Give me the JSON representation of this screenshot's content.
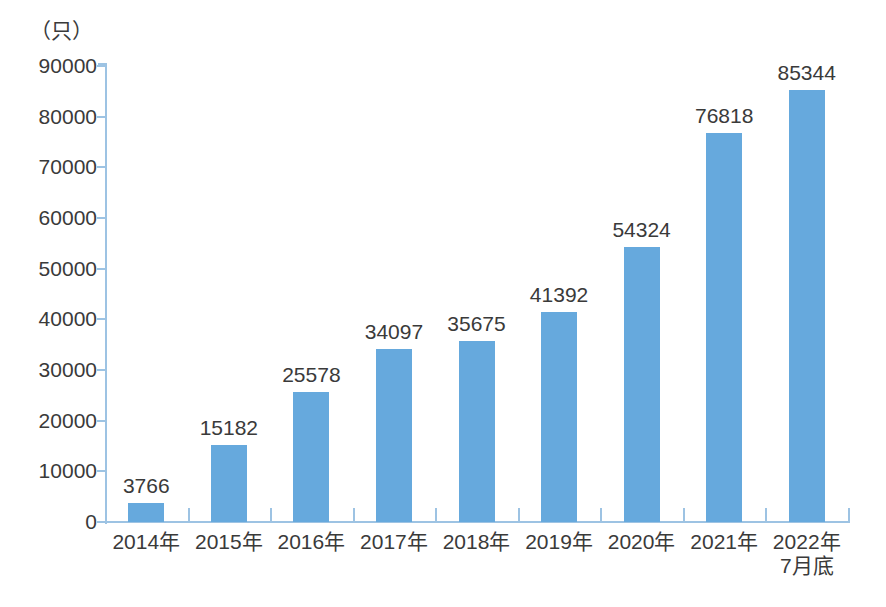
{
  "chart_data": {
    "type": "bar",
    "title": "",
    "subtitle": "",
    "xlabel": "",
    "ylabel": "（只）",
    "unit_caption": "（只）",
    "categories": [
      "2014年",
      "2015年",
      "2016年",
      "2017年",
      "2018年",
      "2019年",
      "2020年",
      "2021年",
      "2022年\n7月底"
    ],
    "category_lines": [
      [
        "2014年"
      ],
      [
        "2015年"
      ],
      [
        "2016年"
      ],
      [
        "2017年"
      ],
      [
        "2018年"
      ],
      [
        "2019年"
      ],
      [
        "2020年"
      ],
      [
        "2021年"
      ],
      [
        "2022年",
        "7月底"
      ]
    ],
    "values": [
      3766,
      15182,
      25578,
      34097,
      35675,
      41392,
      54324,
      76818,
      85344
    ],
    "value_labels": [
      "3766",
      "15182",
      "25578",
      "34097",
      "35675",
      "41392",
      "54324",
      "76818",
      "85344"
    ],
    "ylim": [
      0,
      90000
    ],
    "ytick_values": [
      0,
      10000,
      20000,
      30000,
      40000,
      50000,
      60000,
      70000,
      80000,
      90000
    ],
    "ytick_labels": [
      "0",
      "10000",
      "20000",
      "30000",
      "40000",
      "50000",
      "60000",
      "70000",
      "80000",
      "90000"
    ],
    "grid": false,
    "legend": null,
    "legend_position": "none",
    "series": [
      {
        "name": "",
        "values": [
          3766,
          15182,
          25578,
          34097,
          35675,
          41392,
          54324,
          76818,
          85344
        ]
      }
    ],
    "colors": {
      "bar_fill": "#66a9dd",
      "axis_line": "#9dc3e3",
      "text": "#3a3a3a",
      "background": "#ffffff"
    }
  }
}
